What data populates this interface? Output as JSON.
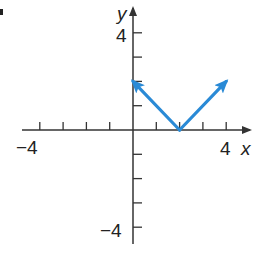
{
  "chart_data": {
    "type": "line",
    "title": "",
    "function": "y = |x - 2|",
    "xlabel": "x",
    "ylabel": "y",
    "xlim": [
      -4,
      4
    ],
    "ylim": [
      -4,
      4
    ],
    "x_tick_labels": [
      "-4",
      "4"
    ],
    "y_tick_labels": [
      "4",
      "-4"
    ],
    "tick_step": 1,
    "grid": false,
    "series": [
      {
        "name": "y = |x - 2|",
        "color": "#2a8ad6",
        "points": [
          [
            0,
            2
          ],
          [
            2,
            0
          ],
          [
            4,
            2
          ]
        ],
        "arrows_at_ends": true
      }
    ]
  },
  "labels": {
    "x_axis": "x",
    "y_axis": "y",
    "x_min": "−4",
    "x_max": "4",
    "y_max": "4",
    "y_min": "−4"
  },
  "colors": {
    "axis": "#333333",
    "curve": "#2a8ad6"
  }
}
